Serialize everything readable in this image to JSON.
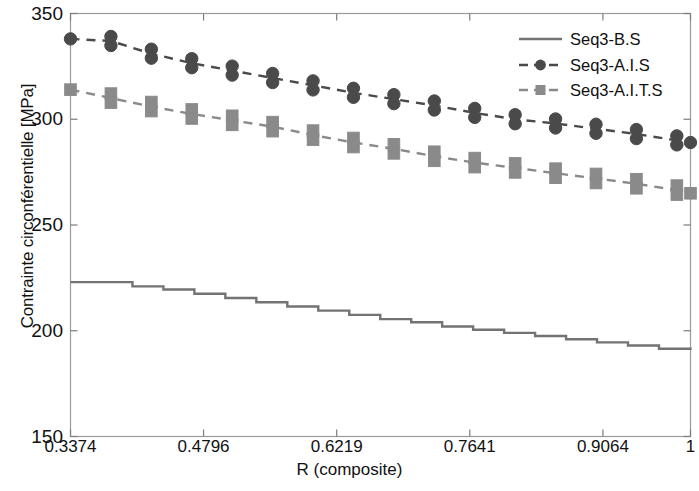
{
  "chart_data": {
    "type": "line",
    "title": "",
    "xlabel": "R (composite)",
    "ylabel": "Contrainte circonférentielle [MPa]",
    "xlim": [
      0.3374,
      1.0
    ],
    "ylim": [
      150,
      350
    ],
    "xticks": [
      "0.3374",
      "0.4796",
      "0.6219",
      "0.7641",
      "0.9064",
      "1"
    ],
    "xtick_values": [
      0.3374,
      0.4796,
      0.6219,
      0.7641,
      0.9064,
      1.0
    ],
    "yticks": [
      "150",
      "200",
      "250",
      "300",
      "350"
    ],
    "ytick_values": [
      150,
      200,
      250,
      300,
      350
    ],
    "grid": false,
    "legend_position": "top-right",
    "series": [
      {
        "name": "Seq3-B.S",
        "style": "solid",
        "marker": "none",
        "color": "#737373",
        "linewidth": 2.4,
        "step": true,
        "x": [
          0.3374,
          0.3705,
          0.4036,
          0.4367,
          0.4698,
          0.5029,
          0.536,
          0.5691,
          0.6022,
          0.6353,
          0.6684,
          0.7015,
          0.7346,
          0.7677,
          0.8008,
          0.8339,
          0.867,
          0.9001,
          0.9332,
          0.9663,
          1.0
        ],
        "y": [
          223.0,
          223.0,
          221.0,
          219.5,
          217.5,
          215.5,
          213.5,
          211.5,
          209.5,
          207.5,
          205.5,
          204.0,
          202.0,
          200.5,
          199.0,
          197.5,
          196.0,
          194.5,
          193.0,
          191.5,
          191.0
        ]
      },
      {
        "name": "Seq3-A.I.S",
        "style": "dashed",
        "marker": "circle",
        "color": "#4a4a4a",
        "linewidth": 2.4,
        "step": false,
        "x": [
          0.3374,
          0.3806,
          0.4238,
          0.467,
          0.5102,
          0.5534,
          0.5966,
          0.6398,
          0.683,
          0.7262,
          0.7694,
          0.8126,
          0.8558,
          0.899,
          0.9422,
          0.9854,
          1.0
        ],
        "y": [
          338.0,
          337.0,
          331.0,
          326.5,
          323.0,
          319.5,
          316.0,
          312.5,
          309.5,
          306.5,
          303.0,
          300.0,
          298.0,
          295.5,
          293.0,
          290.0,
          289.0
        ]
      },
      {
        "name": "Seq3-A.I.T.S",
        "style": "dashed",
        "marker": "square",
        "color": "#8a8a8a",
        "linewidth": 2.4,
        "step": false,
        "x": [
          0.3374,
          0.3806,
          0.4238,
          0.467,
          0.5102,
          0.5534,
          0.5966,
          0.6398,
          0.683,
          0.7262,
          0.7694,
          0.8126,
          0.8558,
          0.899,
          0.9422,
          0.9854,
          1.0
        ],
        "y": [
          314.0,
          310.0,
          306.0,
          302.5,
          299.5,
          296.5,
          292.5,
          289.0,
          286.0,
          282.5,
          279.5,
          277.0,
          274.5,
          272.0,
          269.5,
          266.5,
          265.0
        ]
      }
    ]
  },
  "legend": {
    "entries": [
      {
        "label": "Seq3-B.S"
      },
      {
        "label": "Seq3-A.I.S"
      },
      {
        "label": "Seq3-A.I.T.S"
      }
    ]
  },
  "axes": {
    "x_axis_label": "R (composite)",
    "y_axis_label": "Contrainte circonférentielle [MPa]"
  }
}
